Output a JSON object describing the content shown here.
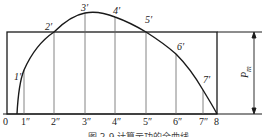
{
  "diagram": {
    "caption": "图 2-9  计算示功的全曲线",
    "x_ticks": [
      {
        "label": "0",
        "x": 7
      },
      {
        "label": "1″",
        "x": 24
      },
      {
        "label": "2″",
        "x": 54
      },
      {
        "label": "3″",
        "x": 85
      },
      {
        "label": "4″",
        "x": 115
      },
      {
        "label": "5″",
        "x": 146
      },
      {
        "label": "6″",
        "x": 176
      },
      {
        "label": "7″",
        "x": 203
      },
      {
        "label": "8",
        "x": 217
      }
    ],
    "curve_points": [
      {
        "label": "1′",
        "x": 24,
        "y": 70
      },
      {
        "label": "2′",
        "x": 54,
        "y": 32
      },
      {
        "label": "3′",
        "x": 85,
        "y": 13
      },
      {
        "label": "4′",
        "x": 115,
        "y": 17
      },
      {
        "label": "5′",
        "x": 146,
        "y": 32
      },
      {
        "label": "6′",
        "x": 176,
        "y": 54
      },
      {
        "label": "7′",
        "x": 203,
        "y": 90
      }
    ],
    "dimension_label": "P",
    "dimension_subscript": "m",
    "colors": {
      "line": "#1a1a1a",
      "thin": "#555555",
      "background": "#ffffff"
    }
  }
}
